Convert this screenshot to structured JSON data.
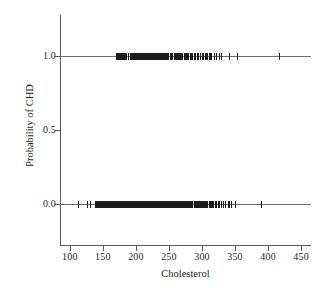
{
  "chart_data": {
    "type": "scatter",
    "title": "",
    "xlabel": "Cholesterol",
    "ylabel": "Probability of CHD",
    "xlim": [
      85,
      465
    ],
    "ylim": [
      -0.28,
      1.28
    ],
    "xticks": [
      100,
      150,
      200,
      250,
      300,
      350,
      400,
      450
    ],
    "xticklabels": [
      "100",
      "150",
      "200",
      "250",
      "300",
      "350",
      "400",
      "450"
    ],
    "yticks": [
      0.0,
      0.5,
      1.0
    ],
    "yticklabels": [
      "0.0",
      "0.5",
      "1.0"
    ],
    "grid": false,
    "legend": null,
    "marker": "vertical-tick",
    "marker_color": "#1c1c1c",
    "axis_color": "#555a5e",
    "background": "#ffffff",
    "series": [
      {
        "name": "CHD = 1",
        "y": 1.0,
        "x": [
          171,
          172,
          174,
          175,
          176,
          176,
          177,
          178,
          180,
          181,
          182,
          183,
          184,
          184,
          186,
          188,
          192,
          193,
          195,
          196,
          197,
          198,
          199,
          200,
          201,
          203,
          204,
          205,
          206,
          207,
          208,
          209,
          210,
          211,
          212,
          213,
          214,
          215,
          216,
          217,
          218,
          219,
          220,
          221,
          222,
          223,
          223,
          224,
          225,
          226,
          227,
          228,
          229,
          229,
          230,
          231,
          232,
          233,
          234,
          234,
          235,
          236,
          237,
          238,
          239,
          240,
          241,
          242,
          243,
          244,
          245,
          246,
          247,
          249,
          250,
          252,
          254,
          255,
          256,
          258,
          259,
          260,
          261,
          262,
          263,
          264,
          265,
          266,
          267,
          268,
          269,
          270,
          271,
          273,
          274,
          275,
          276,
          277,
          278,
          280,
          282,
          283,
          284,
          286,
          288,
          290,
          293,
          294,
          295,
          298,
          300,
          302,
          303,
          305,
          307,
          309,
          311,
          313,
          315,
          319,
          322,
          326,
          330,
          341,
          353,
          417
        ]
      },
      {
        "name": "CHD = 0",
        "y": 0.0,
        "x": [
          113,
          126,
          131,
          139,
          141,
          141,
          142,
          143,
          144,
          145,
          146,
          147,
          148,
          149,
          149,
          150,
          150,
          151,
          152,
          152,
          153,
          154,
          155,
          156,
          157,
          157,
          158,
          159,
          160,
          160,
          161,
          162,
          163,
          164,
          164,
          165,
          166,
          167,
          168,
          168,
          169,
          170,
          170,
          171,
          172,
          172,
          173,
          174,
          175,
          175,
          176,
          177,
          177,
          178,
          178,
          179,
          180,
          180,
          181,
          182,
          182,
          183,
          184,
          185,
          186,
          186,
          187,
          188,
          188,
          189,
          190,
          190,
          191,
          192,
          192,
          193,
          194,
          195,
          195,
          196,
          197,
          197,
          198,
          199,
          199,
          200,
          200,
          201,
          202,
          203,
          203,
          204,
          204,
          205,
          206,
          206,
          207,
          208,
          208,
          209,
          210,
          210,
          211,
          211,
          212,
          213,
          213,
          214,
          215,
          215,
          216,
          217,
          217,
          218,
          219,
          219,
          220,
          221,
          221,
          222,
          223,
          223,
          224,
          225,
          225,
          226,
          227,
          227,
          228,
          229,
          229,
          230,
          230,
          231,
          232,
          233,
          233,
          234,
          234,
          235,
          236,
          236,
          237,
          238,
          239,
          239,
          240,
          240,
          241,
          242,
          243,
          243,
          244,
          245,
          245,
          246,
          247,
          248,
          249,
          249,
          250,
          251,
          252,
          253,
          254,
          254,
          255,
          256,
          257,
          258,
          259,
          260,
          261,
          262,
          263,
          264,
          265,
          266,
          267,
          268,
          269,
          269,
          270,
          271,
          272,
          273,
          274,
          275,
          276,
          277,
          278,
          279,
          281,
          282,
          283,
          284,
          286,
          288,
          289,
          290,
          292,
          293,
          294,
          295,
          296,
          298,
          299,
          300,
          302,
          303,
          304,
          306,
          307,
          308,
          309,
          311,
          313,
          315,
          316,
          318,
          320,
          322,
          325,
          327,
          330,
          333,
          335,
          340,
          342,
          345,
          350,
          390
        ]
      }
    ]
  }
}
